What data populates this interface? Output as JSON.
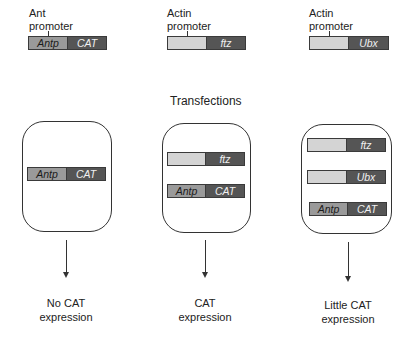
{
  "top_constructs": [
    {
      "promoter_label_line1": "Ant",
      "promoter_label_line2": "promoter",
      "promoter_segment": "Antp",
      "gene_segment": "CAT"
    },
    {
      "promoter_label_line1": "Actin",
      "promoter_label_line2": "promoter",
      "promoter_segment": "",
      "gene_segment": "ftz"
    },
    {
      "promoter_label_line1": "Actin",
      "promoter_label_line2": "promoter",
      "promoter_segment": "",
      "gene_segment": "Ubx"
    }
  ],
  "section_title": "Transfections",
  "cells": [
    {
      "constructs": [
        {
          "promoter": "Antp",
          "gene": "CAT"
        }
      ],
      "result_line1": "No CAT",
      "result_line2": "expression"
    },
    {
      "constructs": [
        {
          "promoter": "",
          "gene": "ftz"
        },
        {
          "promoter": "Antp",
          "gene": "CAT"
        }
      ],
      "result_line1": "CAT",
      "result_line2": "expression"
    },
    {
      "constructs": [
        {
          "promoter": "",
          "gene": "ftz"
        },
        {
          "promoter": "",
          "gene": "Ubx"
        },
        {
          "promoter": "Antp",
          "gene": "CAT"
        }
      ],
      "result_line1": "Little CAT",
      "result_line2": "expression"
    }
  ],
  "colors": {
    "ant_promoter": "#9a9a9a",
    "actin_promoter": "#d4d4d4",
    "gene": "#555555"
  }
}
